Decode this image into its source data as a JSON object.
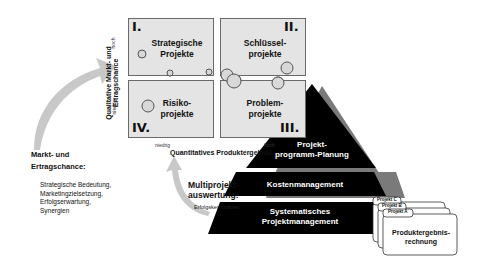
{
  "matrix": {
    "y_axis_label": "Qualitative Markt- und Ertragschance",
    "y_high": "hoch",
    "y_low": "niedrig",
    "x_axis_label": "Quantitatives Produktergebnis",
    "x_low": "niedrig",
    "x_high": "hoch",
    "quadrants": [
      {
        "number": "I.",
        "label_line1": "Strategische",
        "label_line2": "Projekte"
      },
      {
        "number": "II.",
        "label_line1": "Schlüssel-",
        "label_line2": "projekte"
      },
      {
        "number": "III.",
        "label_line1": "Problem-",
        "label_line2": "projekte"
      },
      {
        "number": "IV.",
        "label_line1": "Risiko-",
        "label_line2": "projekte"
      }
    ]
  },
  "left_panel": {
    "title_line1": "Markt- und",
    "title_line2": "Ertragschance:",
    "items": [
      "Strategische Bedeutung,",
      "Marketingzielsetzung,",
      "Erfolgserwartung,",
      "Synergien"
    ]
  },
  "multiproject": {
    "title_line1": "Multiprojekt-",
    "title_line2": "auswertung:",
    "subtitle": "Erfolgskennzahlen"
  },
  "pyramid": {
    "top_line1": "Projekt-",
    "top_line2": "programm-Planung",
    "middle": "Kostenmanagement",
    "bottom_line1": "Systematisches",
    "bottom_line2": "Projektmanagement"
  },
  "cards": {
    "tabs": [
      "Projekt C",
      "Projekt B",
      "Projekt A"
    ],
    "front_line1": "Produktergebnis-",
    "front_line2": "rechnung"
  },
  "colors": {
    "quadrant_fill": "#e4e4e4",
    "arrow_gray": "#c8c8c8",
    "pyramid_black": "#000000",
    "pyramid_shadow": "#7a7a7a"
  }
}
